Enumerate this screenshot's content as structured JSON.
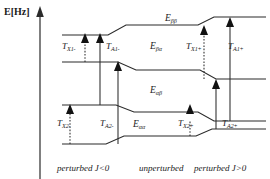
{
  "axis": {
    "label": "E[Hz]"
  },
  "levels": [
    {
      "id": "E_bb",
      "name": "E",
      "sub": "ββ",
      "x": 165,
      "y": 14
    },
    {
      "id": "E_ba",
      "name": "E",
      "sub": "βα",
      "x": 150,
      "y": 42
    },
    {
      "id": "E_ab",
      "name": "E",
      "sub": "αβ",
      "x": 150,
      "y": 86
    },
    {
      "id": "E_aa",
      "name": "E",
      "sub": "αα",
      "x": 133,
      "y": 120
    }
  ],
  "transitions": [
    {
      "id": "T_X1m",
      "name": "T",
      "sub": "X1-",
      "x": 62,
      "y": 42,
      "style": "dotted"
    },
    {
      "id": "T_A1m",
      "name": "T",
      "sub": "A1-",
      "x": 106,
      "y": 42,
      "style": "solid"
    },
    {
      "id": "T_X1p",
      "name": "T",
      "sub": "X1+",
      "x": 186,
      "y": 42,
      "style": "dotted"
    },
    {
      "id": "T_A1p",
      "name": "T",
      "sub": "A1+",
      "x": 228,
      "y": 42,
      "style": "solid"
    },
    {
      "id": "T_X2m",
      "name": "T",
      "sub": "X2-",
      "x": 57,
      "y": 119,
      "style": "dotted"
    },
    {
      "id": "T_A2m",
      "name": "T",
      "sub": "A2-",
      "x": 100,
      "y": 119,
      "style": "solid"
    },
    {
      "id": "T_X2p",
      "name": "T",
      "sub": "X2+",
      "x": 178,
      "y": 119,
      "style": "dotted"
    },
    {
      "id": "T_A2p",
      "name": "T",
      "sub": "A2+",
      "x": 222,
      "y": 119,
      "style": "solid"
    }
  ],
  "zones": [
    {
      "id": "zone-left",
      "text": "perturbed J<0",
      "x": 57,
      "y": 163
    },
    {
      "id": "zone-middle",
      "text": "unperturbed",
      "x": 139,
      "y": 163
    },
    {
      "id": "zone-right",
      "text": "perturbed J>0",
      "x": 194,
      "y": 163
    }
  ],
  "colors": {
    "ink": "#2b2b2b",
    "background": "#ffffff"
  }
}
